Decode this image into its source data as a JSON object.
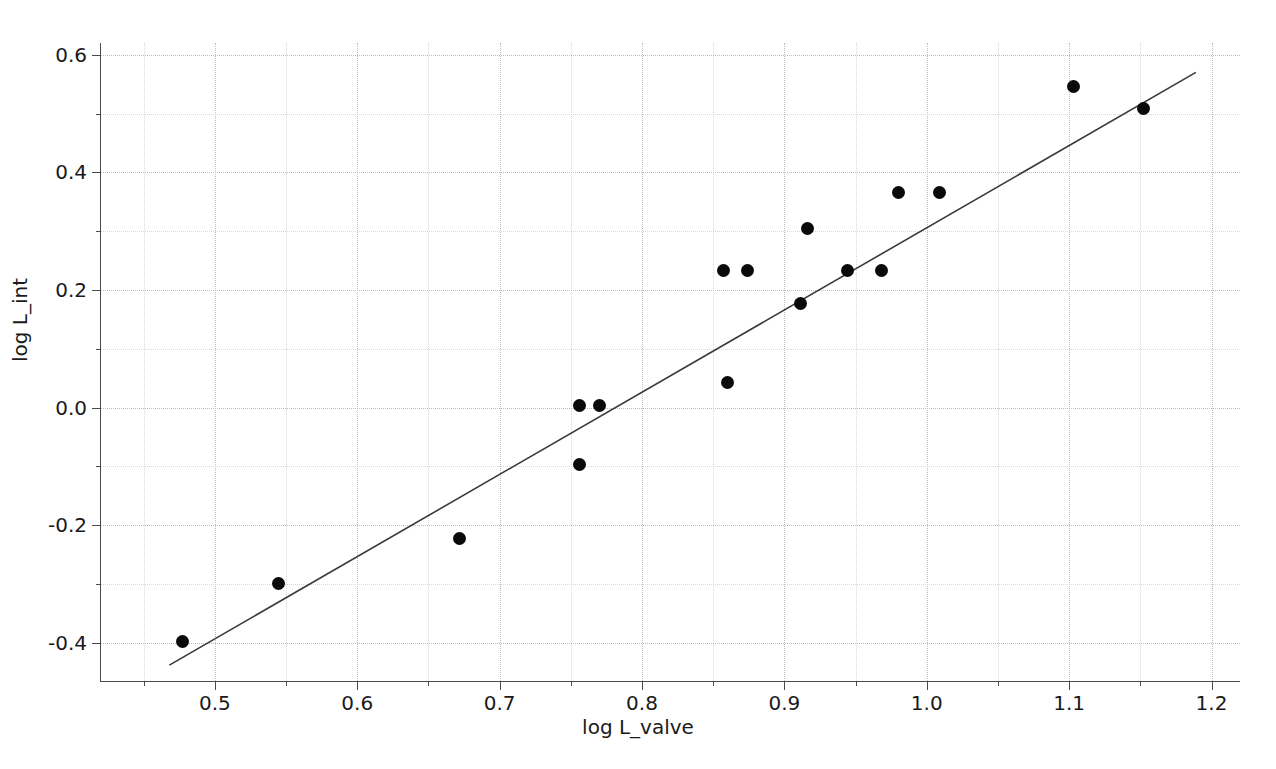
{
  "chart_data": {
    "type": "scatter",
    "title": "",
    "xlabel": "log L_valve",
    "ylabel": "log L_int",
    "xlim": [
      0.42,
      1.22
    ],
    "ylim": [
      -0.465,
      0.62
    ],
    "grid": true,
    "legend": null,
    "xticks": [
      "0.5",
      "0.6",
      "0.7",
      "0.8",
      "0.9",
      "1.0",
      "1.1",
      "1.2"
    ],
    "xtick_values": [
      0.5,
      0.6,
      0.7,
      0.8,
      0.9,
      1.0,
      1.1,
      1.2
    ],
    "xminor_values": [
      0.45,
      0.55,
      0.65,
      0.75,
      0.85,
      0.95,
      1.05,
      1.15
    ],
    "yticks": [
      "0.6",
      "0.4",
      "0.2",
      "0.0",
      "-0.2",
      "-0.4"
    ],
    "ytick_values": [
      0.6,
      0.4,
      0.2,
      0.0,
      -0.2,
      -0.4
    ],
    "yminor_values": [
      0.5,
      0.3,
      0.1,
      -0.1,
      -0.3
    ],
    "series": [
      {
        "name": "observations",
        "marker": "filled-circle",
        "color": "#0a0a0a",
        "points": [
          {
            "x": 0.477,
            "y": -0.398
          },
          {
            "x": 0.545,
            "y": -0.299
          },
          {
            "x": 0.672,
            "y": -0.222
          },
          {
            "x": 0.756,
            "y": 0.003
          },
          {
            "x": 0.756,
            "y": -0.097
          },
          {
            "x": 0.77,
            "y": 0.003
          },
          {
            "x": 0.857,
            "y": 0.233
          },
          {
            "x": 0.86,
            "y": 0.042
          },
          {
            "x": 0.874,
            "y": 0.233
          },
          {
            "x": 0.911,
            "y": 0.177
          },
          {
            "x": 0.916,
            "y": 0.305
          },
          {
            "x": 0.944,
            "y": 0.233
          },
          {
            "x": 0.968,
            "y": 0.233
          },
          {
            "x": 0.98,
            "y": 0.365
          },
          {
            "x": 1.009,
            "y": 0.365
          },
          {
            "x": 1.103,
            "y": 0.546
          },
          {
            "x": 1.152,
            "y": 0.509
          }
        ]
      }
    ],
    "fit_line": {
      "name": "regression-line",
      "color": "#3a3a3a",
      "x_start": 0.468,
      "y_start": -0.438,
      "x_end": 1.189,
      "y_end": 0.57
    }
  },
  "caption": {
    "text": ""
  }
}
